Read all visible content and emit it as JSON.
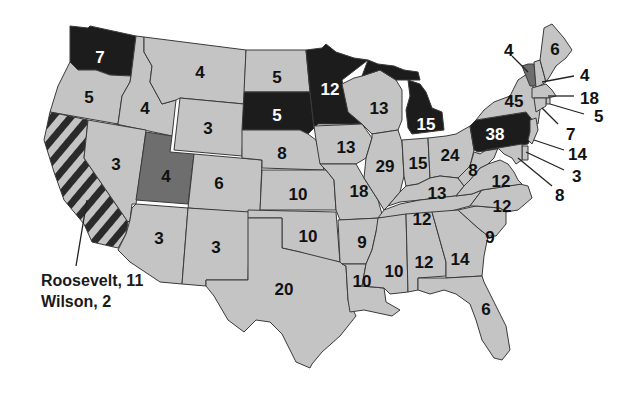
{
  "colors": {
    "wilson": "#c4c4c4",
    "roosevelt": "#1c1c1c",
    "taft": "#6e6e6e",
    "split_stripe_dark": "#2a2a2a",
    "split_stripe_light": "#c4c4c4",
    "border": "#3a3a3a",
    "label_dark": "#111111",
    "label_light": "#ffffff"
  },
  "states": [
    {
      "id": "WA",
      "value": "7",
      "winner": "roosevelt"
    },
    {
      "id": "OR",
      "value": "5",
      "winner": "wilson"
    },
    {
      "id": "CA",
      "value": "",
      "winner": "split"
    },
    {
      "id": "ID",
      "value": "4",
      "winner": "wilson"
    },
    {
      "id": "NV",
      "value": "3",
      "winner": "wilson"
    },
    {
      "id": "MT",
      "value": "4",
      "winner": "wilson"
    },
    {
      "id": "WY",
      "value": "3",
      "winner": "wilson"
    },
    {
      "id": "UT",
      "value": "4",
      "winner": "taft"
    },
    {
      "id": "CO",
      "value": "6",
      "winner": "wilson"
    },
    {
      "id": "AZ",
      "value": "3",
      "winner": "wilson"
    },
    {
      "id": "NM",
      "value": "3",
      "winner": "wilson"
    },
    {
      "id": "ND",
      "value": "5",
      "winner": "wilson"
    },
    {
      "id": "SD",
      "value": "5",
      "winner": "roosevelt"
    },
    {
      "id": "NE",
      "value": "8",
      "winner": "wilson"
    },
    {
      "id": "KS",
      "value": "10",
      "winner": "wilson"
    },
    {
      "id": "OK",
      "value": "10",
      "winner": "wilson"
    },
    {
      "id": "TX",
      "value": "20",
      "winner": "wilson"
    },
    {
      "id": "MN",
      "value": "12",
      "winner": "roosevelt"
    },
    {
      "id": "IA",
      "value": "13",
      "winner": "wilson"
    },
    {
      "id": "MO",
      "value": "18",
      "winner": "wilson"
    },
    {
      "id": "AR",
      "value": "9",
      "winner": "wilson"
    },
    {
      "id": "LA",
      "value": "10",
      "winner": "wilson"
    },
    {
      "id": "WI",
      "value": "13",
      "winner": "wilson"
    },
    {
      "id": "IL",
      "value": "29",
      "winner": "wilson"
    },
    {
      "id": "MI",
      "value": "15",
      "winner": "roosevelt"
    },
    {
      "id": "IN",
      "value": "15",
      "winner": "wilson"
    },
    {
      "id": "OH",
      "value": "24",
      "winner": "wilson"
    },
    {
      "id": "KY",
      "value": "13",
      "winner": "wilson"
    },
    {
      "id": "TN",
      "value": "12",
      "winner": "wilson"
    },
    {
      "id": "MS",
      "value": "10",
      "winner": "wilson"
    },
    {
      "id": "AL",
      "value": "12",
      "winner": "wilson"
    },
    {
      "id": "GA",
      "value": "14",
      "winner": "wilson"
    },
    {
      "id": "FL",
      "value": "6",
      "winner": "wilson"
    },
    {
      "id": "SC",
      "value": "9",
      "winner": "wilson"
    },
    {
      "id": "NC",
      "value": "12",
      "winner": "wilson"
    },
    {
      "id": "VA",
      "value": "12",
      "winner": "wilson"
    },
    {
      "id": "WV",
      "value": "8",
      "winner": "wilson"
    },
    {
      "id": "PA",
      "value": "38",
      "winner": "roosevelt"
    },
    {
      "id": "NY",
      "value": "45",
      "winner": "wilson"
    },
    {
      "id": "VT",
      "value": "4",
      "winner": "taft"
    },
    {
      "id": "NH",
      "value": "4",
      "winner": "wilson"
    },
    {
      "id": "ME",
      "value": "6",
      "winner": "wilson"
    },
    {
      "id": "MA",
      "value": "18",
      "winner": "wilson"
    },
    {
      "id": "RI",
      "value": "5",
      "winner": "wilson"
    },
    {
      "id": "CT",
      "value": "7",
      "winner": "wilson"
    },
    {
      "id": "NJ",
      "value": "14",
      "winner": "wilson"
    },
    {
      "id": "DE",
      "value": "3",
      "winner": "wilson"
    },
    {
      "id": "MD",
      "value": "8",
      "winner": "wilson"
    }
  ],
  "callouts": {
    "california_line1": "Roosevelt, 11",
    "california_line2": "Wilson, 2"
  }
}
